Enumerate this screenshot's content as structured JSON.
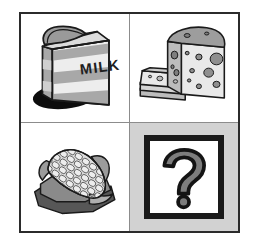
{
  "figure": {
    "type": "visual-analogy-matrix",
    "layout": "2x2 grid",
    "frame_color": "#2b2b2b",
    "divider_color": "#8c8c8c",
    "background_color": "#ffffff"
  },
  "cells": [
    {
      "position": "top-left",
      "icon_name": "milk-carton-icon",
      "label": "Milk carton",
      "package_text": "MILK",
      "background_color": "#ffffff",
      "has_shadow": true,
      "shadow_color": "#0d0d0d",
      "fill_color": "#e8e8e8",
      "stripe_color": "#a6a6a6",
      "outline_color": "#1a1a1a"
    },
    {
      "position": "top-right",
      "icon_name": "swiss-cheese-icon",
      "label": "Swiss cheese block with slices",
      "background_color": "#ffffff",
      "fill_color": "#e3e3e3",
      "side_color": "#bdbdbd",
      "top_color": "#9e9e9e",
      "hole_color": "#8f8f8f",
      "outline_color": "#1a1a1a"
    },
    {
      "position": "bottom-left",
      "icon_name": "corn-cob-icon",
      "label": "Corn on the cob with husk",
      "background_color": "#ffffff",
      "kernel_color": "#d8d8d8",
      "cob_color": "#b5b5b5",
      "husk_color": "#8a8a8a",
      "husk_dark_color": "#5a5a5a",
      "outline_color": "#1a1a1a"
    },
    {
      "position": "bottom-right",
      "icon_name": "question-mark-icon",
      "label": "Unknown / missing item",
      "glyph": "?",
      "background_color": "#d2d2d2",
      "box_background_color": "#ffffff",
      "box_border_color": "#1a1a1a",
      "glyph_outline_color": "#141414",
      "glyph_fill_color": "#7d7d7d"
    }
  ]
}
